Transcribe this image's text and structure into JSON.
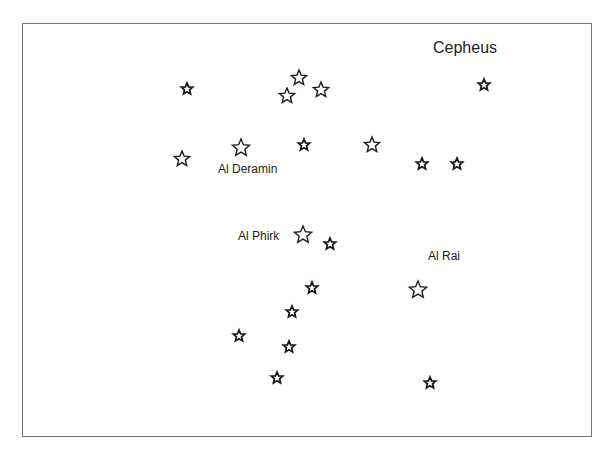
{
  "title": "Cepheus",
  "labels": [
    {
      "id": "al-deramin",
      "text": "Al Deramin",
      "x": 218,
      "y": 162
    },
    {
      "id": "al-phirk",
      "text": "Al Phirk",
      "x": 238,
      "y": 229
    },
    {
      "id": "al-rai",
      "text": "Al Rai",
      "x": 428,
      "y": 249
    }
  ],
  "stars": [
    {
      "x": 187,
      "y": 89,
      "r": 6
    },
    {
      "x": 299,
      "y": 78,
      "r": 8
    },
    {
      "x": 287,
      "y": 96,
      "r": 8
    },
    {
      "x": 321,
      "y": 90,
      "r": 8
    },
    {
      "x": 484,
      "y": 85,
      "r": 6
    },
    {
      "x": 182,
      "y": 159,
      "r": 8
    },
    {
      "x": 241,
      "y": 148,
      "r": 9
    },
    {
      "x": 304,
      "y": 145,
      "r": 6
    },
    {
      "x": 372,
      "y": 145,
      "r": 8
    },
    {
      "x": 422,
      "y": 164,
      "r": 6
    },
    {
      "x": 457,
      "y": 164,
      "r": 6
    },
    {
      "x": 303,
      "y": 235,
      "r": 9
    },
    {
      "x": 330,
      "y": 244,
      "r": 6
    },
    {
      "x": 418,
      "y": 290,
      "r": 9
    },
    {
      "x": 312,
      "y": 288,
      "r": 6
    },
    {
      "x": 292,
      "y": 312,
      "r": 6
    },
    {
      "x": 239,
      "y": 336,
      "r": 6
    },
    {
      "x": 289,
      "y": 347,
      "r": 6
    },
    {
      "x": 277,
      "y": 378,
      "r": 6
    },
    {
      "x": 430,
      "y": 383,
      "r": 6
    }
  ],
  "colors": {
    "star_stroke": "#1a1a1a",
    "frame": "#777777",
    "text": "#222222"
  }
}
